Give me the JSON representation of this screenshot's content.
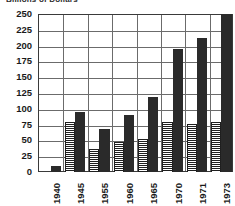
{
  "chart_data": {
    "type": "bar",
    "title": "Billions of Dollars",
    "xlabel": "",
    "ylabel": "",
    "categories": [
      "1940",
      "1945",
      "1955",
      "1960",
      "1965",
      "1970",
      "1971",
      "1973"
    ],
    "series": [
      {
        "name": "hatched",
        "values": [
          0,
          79,
          36,
          48,
          52,
          79,
          76,
          79
        ]
      },
      {
        "name": "solid",
        "values": [
          10,
          95,
          68,
          90,
          119,
          195,
          212,
          250
        ]
      }
    ],
    "ylim": [
      0,
      250
    ],
    "yticks": [
      0,
      25,
      50,
      75,
      100,
      125,
      150,
      175,
      200,
      225,
      250
    ],
    "ytick_labels": [
      "0",
      "25",
      "50",
      "75",
      "100",
      "125",
      "150",
      "175",
      "200",
      "225",
      "250"
    ],
    "grid": true,
    "legend": "none",
    "colors": {
      "solid": "#2a2a2a",
      "hatch": "#1f1f1f",
      "frame": "#3a3a3a",
      "grid": "#6b6b6b"
    }
  }
}
